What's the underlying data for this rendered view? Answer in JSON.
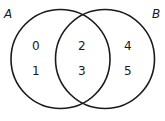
{
  "diagram": {
    "type": "venn",
    "sets": [
      {
        "name": "A",
        "label": "A",
        "only": [
          "0",
          "1"
        ]
      },
      {
        "name": "B",
        "label": "B",
        "only": [
          "4",
          "5"
        ]
      }
    ],
    "intersection": [
      "2",
      "3"
    ],
    "elements": {
      "a_only_1": "0",
      "a_only_2": "1",
      "both_1": "2",
      "both_2": "3",
      "b_only_1": "4",
      "b_only_2": "5"
    },
    "stroke_color": "#1a1a1a"
  }
}
